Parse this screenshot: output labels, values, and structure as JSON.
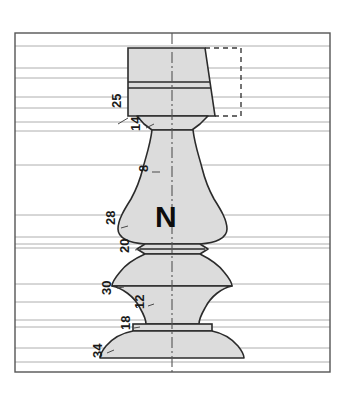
{
  "figure": {
    "type": "patent-technical-drawing",
    "part_label": {
      "main": "N",
      "subscript": "R"
    },
    "colors": {
      "body_fill": "#dcdcdc",
      "outline": "#2b2b2b",
      "extension_line": "#9a9a9a",
      "border": "#555555",
      "centerline": "#555555",
      "background": "#ffffff",
      "label_text": "#1a1a1a"
    },
    "border": {
      "x": 15,
      "y": 33,
      "width": 315,
      "height": 339
    },
    "centerline": {
      "x": 172,
      "y_top": 33,
      "y_bottom": 372
    },
    "reference_numerals": [
      {
        "text": "25",
        "x": 121,
        "y": 108,
        "rotation": -90,
        "leader_y": 97
      },
      {
        "text": "14",
        "x": 140,
        "y": 131,
        "rotation": -90,
        "leader_y": 122
      },
      {
        "text": "8",
        "x": 148,
        "y": 172,
        "rotation": -90,
        "leader_y": 165
      },
      {
        "text": "28",
        "x": 115,
        "y": 225,
        "rotation": -90,
        "leader_y": 215
      },
      {
        "text": "20",
        "x": 129,
        "y": 253,
        "rotation": -90,
        "leader_y": 244
      },
      {
        "text": "30",
        "x": 111,
        "y": 295,
        "rotation": -90,
        "leader_y": 284
      },
      {
        "text": "12",
        "x": 144,
        "y": 309,
        "rotation": -90,
        "leader_y": 302
      },
      {
        "text": "18",
        "x": 130,
        "y": 330,
        "rotation": -90,
        "leader_y": 323
      },
      {
        "text": "34",
        "x": 102,
        "y": 358,
        "rotation": -90,
        "leader_y": 348
      }
    ],
    "extension_lines_y": [
      46,
      68,
      78,
      82,
      88,
      97,
      108,
      122,
      131,
      165,
      215,
      237,
      244,
      248,
      284,
      302,
      320,
      323,
      327,
      348,
      362
    ],
    "dashed_projection": {
      "x": 205,
      "y": 48,
      "width": 36,
      "height": 68,
      "note": "dashed rectangle projection at upper right of top block"
    },
    "top_block": {
      "left": 128,
      "right_top": 205,
      "right_bottom": 215,
      "top": 48,
      "bottom": 116,
      "band_lines_y": [
        82,
        88
      ]
    }
  }
}
